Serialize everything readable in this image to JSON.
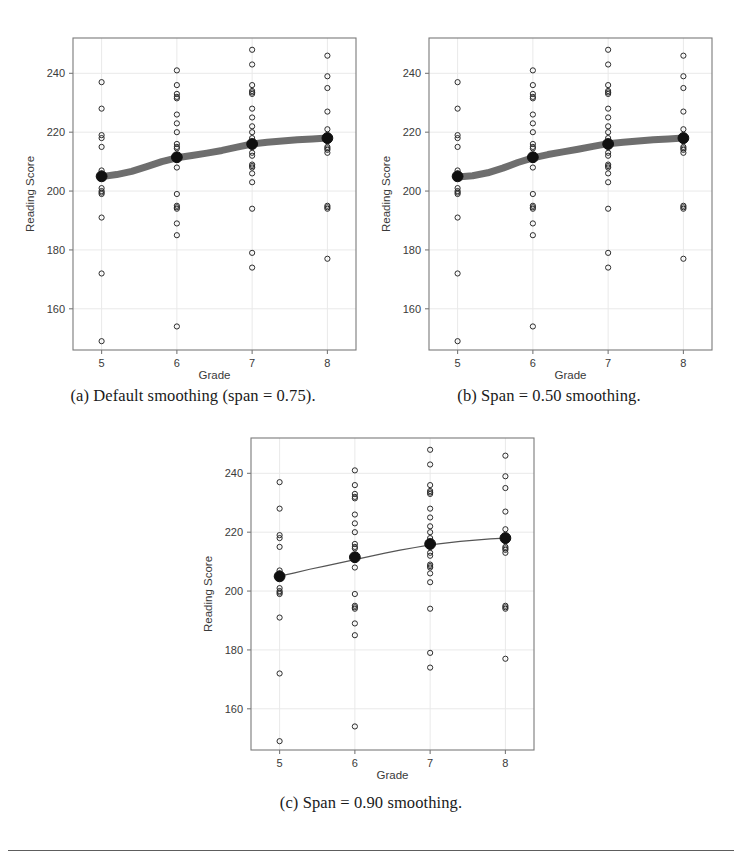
{
  "page": {
    "background": "#ffffff",
    "rule": {
      "visible": true,
      "color": "#5d5d5d",
      "x": 8,
      "y": 850,
      "width": 726
    }
  },
  "panels": [
    {
      "id": "panel-a",
      "caption": "(a) Default smoothing (span = 0.75).",
      "caption_label": "(a)",
      "span": "0.75",
      "curve_style": "thick-band",
      "x": 18,
      "y": 28,
      "width": 350,
      "height": 352,
      "caption_x": 18,
      "caption_y": 386,
      "caption_width": 350
    },
    {
      "id": "panel-b",
      "caption": "(b) Span = 0.50 smoothing.",
      "caption_label": "(b)",
      "span": "0.50",
      "curve_style": "thick-band",
      "x": 374,
      "y": 28,
      "width": 350,
      "height": 352,
      "caption_x": 374,
      "caption_y": 386,
      "caption_width": 350
    },
    {
      "id": "panel-c",
      "caption": "(c) Span = 0.90 smoothing.",
      "caption_label": "(c)",
      "span": "0.90",
      "curve_style": "thin-line",
      "x": 196,
      "y": 428,
      "width": 350,
      "height": 352,
      "caption_x": 196,
      "caption_y": 793,
      "caption_width": 350
    }
  ],
  "chart_data": {
    "type": "scatter",
    "title": "",
    "xlabel": "Grade",
    "ylabel": "Reading Score",
    "xlim": [
      4.62,
      8.38
    ],
    "ylim": [
      146,
      252
    ],
    "xticks": [
      5,
      6,
      7,
      8
    ],
    "xtick_labels": [
      "5",
      "6",
      "7",
      "8"
    ],
    "yticks": [
      160,
      180,
      200,
      220,
      240
    ],
    "ytick_labels": [
      "160",
      "180",
      "200",
      "220",
      "240"
    ],
    "grid": true,
    "legend": "none",
    "colors": {
      "point_stroke": "#2b2b2b",
      "mean_point": "#101010",
      "smoother": "#555555",
      "frame": "#7a7a7a",
      "grid": "#e9e9e9"
    },
    "marker": {
      "shape": "open-circle",
      "radius": 2.6
    },
    "mean_marker": {
      "shape": "filled-circle",
      "radius": 5.4
    },
    "series": [
      {
        "name": "Grade 5 reading scores",
        "x": 5,
        "values": [
          237,
          228,
          219,
          218,
          215,
          207,
          206,
          205.5,
          205,
          205,
          204.8,
          204.5,
          201,
          200,
          199.5,
          199,
          191,
          172,
          149
        ]
      },
      {
        "name": "Grade 6 reading scores",
        "x": 6,
        "values": [
          241,
          236,
          233,
          232,
          231.5,
          226,
          223,
          220,
          216,
          215,
          214.5,
          212,
          211.5,
          211,
          210.5,
          208,
          199,
          195,
          194.5,
          194,
          189,
          185,
          154
        ]
      },
      {
        "name": "Grade 7 reading scores",
        "x": 7,
        "values": [
          248,
          243,
          236,
          234,
          233.5,
          233,
          228,
          225,
          222,
          220,
          218,
          216.5,
          216,
          215.5,
          215,
          213,
          212,
          209,
          208.5,
          208,
          206,
          203,
          194,
          179,
          174
        ]
      },
      {
        "name": "Grade 8 reading scores",
        "x": 8,
        "values": [
          246,
          239,
          235,
          227,
          221,
          219,
          218,
          217.5,
          217,
          215,
          214.5,
          214,
          213,
          195,
          194.5,
          194,
          177
        ]
      }
    ],
    "means": {
      "name": "Grade mean reading score",
      "x": [
        5,
        6,
        7,
        8
      ],
      "values": [
        205,
        211.5,
        216,
        218
      ]
    },
    "smoothers": [
      {
        "panel": "panel-a",
        "span": 0.75,
        "x": [
          5.0,
          5.2,
          5.4,
          5.6,
          5.8,
          6.0,
          6.2,
          6.4,
          6.6,
          6.8,
          7.0,
          7.2,
          7.4,
          7.6,
          7.8,
          8.0
        ],
        "y": [
          204.9,
          205.6,
          206.7,
          208.3,
          210.0,
          211.3,
          212.1,
          212.9,
          213.8,
          214.9,
          216.0,
          216.6,
          217.0,
          217.4,
          217.7,
          218.0
        ]
      },
      {
        "panel": "panel-b",
        "span": 0.5,
        "x": [
          5.0,
          5.2,
          5.4,
          5.6,
          5.8,
          6.0,
          6.2,
          6.4,
          6.6,
          6.8,
          7.0,
          7.2,
          7.4,
          7.6,
          7.8,
          8.0
        ],
        "y": [
          204.8,
          205.2,
          206.2,
          207.8,
          209.7,
          211.3,
          212.4,
          213.3,
          214.2,
          215.2,
          216.1,
          216.6,
          217.0,
          217.4,
          217.7,
          218.0
        ]
      },
      {
        "panel": "panel-c",
        "span": 0.9,
        "x": [
          5.0,
          5.2,
          5.4,
          5.6,
          5.8,
          6.0,
          6.2,
          6.4,
          6.6,
          6.8,
          7.0,
          7.2,
          7.4,
          7.6,
          7.8,
          8.0
        ],
        "y": [
          205.1,
          206.2,
          207.4,
          208.5,
          209.6,
          210.7,
          211.8,
          212.9,
          213.9,
          214.8,
          215.7,
          216.3,
          216.9,
          217.3,
          217.7,
          218.0
        ]
      }
    ]
  }
}
